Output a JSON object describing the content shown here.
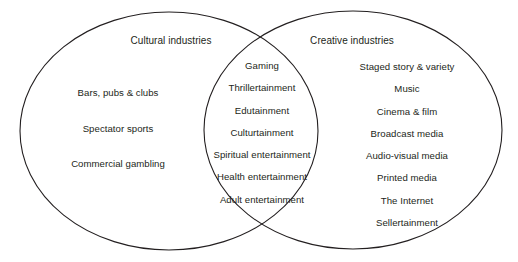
{
  "diagram": {
    "type": "venn",
    "title_left": "Cultural industries",
    "title_right": "Creative industries",
    "line_color": "#231f20",
    "background_color": "#ffffff",
    "sets": {
      "left_only": {
        "label": "Cultural industries",
        "items": [
          "Bars, pubs & clubs",
          "Spectator sports",
          "Commercial gambling"
        ]
      },
      "intersection": {
        "items": [
          "Gaming",
          "Thrillertainment",
          "Edutainment",
          "Culturtainment",
          "Spiritual entertainment",
          "Health entertainment",
          "Adult entertainment"
        ]
      },
      "right_only": {
        "label": "Creative industries",
        "items": [
          "Staged story & variety",
          "Music",
          "Cinema & film",
          "Broadcast media",
          "Audio-visual media",
          "Printed media",
          "The Internet",
          "Sellertainment"
        ]
      }
    }
  }
}
